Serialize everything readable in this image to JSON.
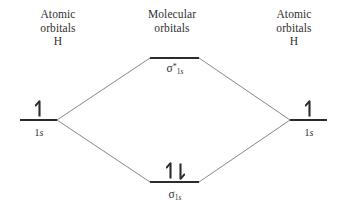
{
  "figure": {
    "type": "molecular-orbital-energy-diagram",
    "molecule": "H2",
    "background_color": "#ffffff",
    "level_line_color": "#2b2b2b",
    "correlation_line_color": "#7a7a7a",
    "text_color": "#2f2f2f"
  },
  "headers": {
    "left": "Atomic\norbitals\nH",
    "middle": "Molecular\norbitals",
    "right": "Atomic\norbitals\nH"
  },
  "levels": [
    {
      "id": "ao-left",
      "kind": "atomic",
      "side": "left",
      "label_sigma": "",
      "label_text": "1",
      "label_italic": "s",
      "label_superscript": "",
      "electrons": [
        "up"
      ],
      "electron_count": 1,
      "x1": 20,
      "x2": 57,
      "y": 120
    },
    {
      "id": "ao-right",
      "kind": "atomic",
      "side": "right",
      "label_sigma": "",
      "label_text": "1",
      "label_italic": "s",
      "label_superscript": "",
      "electrons": [
        "up"
      ],
      "electron_count": 1,
      "x1": 290,
      "x2": 327,
      "y": 120
    },
    {
      "id": "mo-antibonding",
      "kind": "molecular",
      "side": "center",
      "label_sigma": "σ",
      "label_text": "1",
      "label_italic": "s",
      "label_superscript": "*",
      "electrons": [],
      "electron_count": 0,
      "x1": 150,
      "x2": 199,
      "y": 58
    },
    {
      "id": "mo-bonding",
      "kind": "molecular",
      "side": "center",
      "label_sigma": "σ",
      "label_text": "1",
      "label_italic": "s",
      "label_superscript": "",
      "electrons": [
        "up",
        "down"
      ],
      "electron_count": 2,
      "x1": 150,
      "x2": 199,
      "y": 182
    }
  ],
  "correlation_lines": [
    {
      "name": "left-to-antibonding",
      "x1": 57,
      "y1": 120,
      "x2": 150,
      "y2": 58
    },
    {
      "name": "left-to-bonding",
      "x1": 57,
      "y1": 120,
      "x2": 150,
      "y2": 182
    },
    {
      "name": "right-to-antibonding",
      "x1": 290,
      "y1": 120,
      "x2": 199,
      "y2": 58
    },
    {
      "name": "right-to-bonding",
      "x1": 290,
      "y1": 120,
      "x2": 199,
      "y2": 182
    }
  ]
}
